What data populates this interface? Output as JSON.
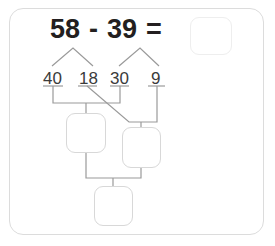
{
  "worksheet": {
    "equation": {
      "left_operand": "58",
      "operator": "-",
      "right_operand": "39",
      "equals": "=",
      "result_value": "",
      "result_placeholder": ""
    },
    "decomposition": {
      "parts": [
        {
          "name": "tens-of-minuend",
          "value": "40"
        },
        {
          "name": "ones-of-minuend",
          "value": "18"
        },
        {
          "name": "tens-of-subtrahend",
          "value": "30"
        },
        {
          "name": "ones-of-subtrahend",
          "value": "9"
        }
      ]
    },
    "answer_boxes": [
      {
        "name": "left-partial-answer",
        "value": ""
      },
      {
        "name": "right-partial-answer",
        "value": ""
      },
      {
        "name": "final-answer",
        "value": ""
      }
    ],
    "colors": {
      "card_border": "#dcdcdc",
      "text": "#231f20",
      "part_text": "#3b3b3b",
      "connector_line": "#9a9a9a",
      "box_border": "#d8d8d8",
      "result_box_border": "#eeeeee",
      "background": "#ffffff"
    }
  }
}
